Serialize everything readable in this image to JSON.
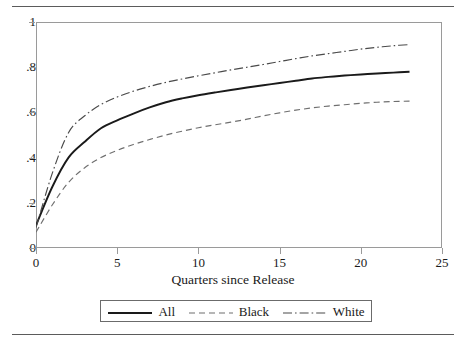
{
  "figure": {
    "has_top_rule": true,
    "has_bottom_rule": true,
    "rule_color": "#5b5b5b",
    "frame_color": "#9a9a9a",
    "background": "#ffffff"
  },
  "axis": {
    "y_ticks": [
      "0",
      ".2",
      ".4",
      ".6",
      ".8",
      "1"
    ],
    "x_ticks": [
      "0",
      "5",
      "10",
      "15",
      "20",
      "25"
    ],
    "x_title": "Quarters since Release"
  },
  "legend": {
    "items": [
      {
        "label": "All",
        "style": "solid",
        "color": "#1a1a1a",
        "width": 1.9
      },
      {
        "label": "Black",
        "style": "dashed",
        "color": "#6f6f6f",
        "width": 1.2
      },
      {
        "label": "White",
        "style": "dashdot",
        "color": "#4a4a4a",
        "width": 1.2
      }
    ]
  },
  "chart_data": {
    "type": "line",
    "title": "",
    "subtitle": "",
    "xlabel": "Quarters since Release",
    "ylabel": "",
    "xlim": [
      0,
      25
    ],
    "ylim": [
      0,
      1
    ],
    "xticks": [
      0,
      5,
      10,
      15,
      20,
      25
    ],
    "yticks": [
      0,
      0.2,
      0.4,
      0.6,
      0.8,
      1
    ],
    "grid": false,
    "legend_position": "bottom",
    "x": [
      0,
      1,
      2,
      3,
      4,
      5,
      6,
      7,
      8,
      9,
      10,
      11,
      12,
      13,
      14,
      15,
      16,
      17,
      18,
      19,
      20,
      21,
      22,
      23
    ],
    "series": [
      {
        "name": "All",
        "style": "solid",
        "color": "#1a1a1a",
        "values": [
          0.1,
          0.27,
          0.4,
          0.47,
          0.53,
          0.565,
          0.595,
          0.622,
          0.645,
          0.662,
          0.676,
          0.688,
          0.699,
          0.71,
          0.72,
          0.73,
          0.74,
          0.75,
          0.757,
          0.763,
          0.768,
          0.772,
          0.776,
          0.78
        ]
      },
      {
        "name": "Black",
        "style": "dashed",
        "color": "#6f6f6f",
        "values": [
          0.07,
          0.19,
          0.29,
          0.355,
          0.4,
          0.432,
          0.458,
          0.48,
          0.5,
          0.517,
          0.532,
          0.545,
          0.557,
          0.57,
          0.585,
          0.598,
          0.61,
          0.62,
          0.628,
          0.634,
          0.64,
          0.645,
          0.648,
          0.65
        ]
      },
      {
        "name": "White",
        "style": "dashdot",
        "color": "#4a4a4a",
        "values": [
          0.09,
          0.33,
          0.51,
          0.585,
          0.635,
          0.668,
          0.694,
          0.715,
          0.733,
          0.748,
          0.762,
          0.775,
          0.788,
          0.8,
          0.812,
          0.825,
          0.838,
          0.85,
          0.86,
          0.87,
          0.88,
          0.888,
          0.895,
          0.9
        ]
      }
    ]
  }
}
